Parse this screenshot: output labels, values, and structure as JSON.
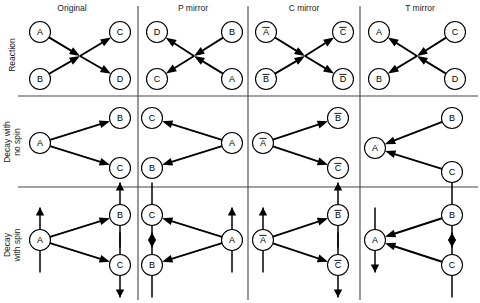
{
  "figure": {
    "background_color": "#ffffff",
    "line_color": "#000000",
    "grid_color": "#444444"
  },
  "columns": [
    {
      "key": "original",
      "label": "Original",
      "center_x": 72
    },
    {
      "key": "p_mirror",
      "label": "P mirror",
      "center_x": 193
    },
    {
      "key": "c_mirror",
      "label": "C mirror",
      "center_x": 304
    },
    {
      "key": "t_mirror",
      "label": "T mirror",
      "center_x": 420
    }
  ],
  "rows": [
    {
      "key": "reaction",
      "label": "Reaction",
      "label_lines": [
        "Reaction"
      ],
      "center_y": 55
    },
    {
      "key": "decay_no_spin",
      "label": "Decay with no spin",
      "label_lines": [
        "Decay with",
        "no spin"
      ],
      "center_y": 142
    },
    {
      "key": "decay_with_spin",
      "label": "Decay with spin",
      "label_lines": [
        "Decay",
        "with spin"
      ],
      "center_y": 245
    }
  ],
  "grid": {
    "horizontal_rules": [
      96,
      187
    ],
    "vertical_rules": [
      138,
      248,
      360
    ],
    "rule_x_start": 18,
    "rule_x_end": 478,
    "rule_y_start": 6,
    "rule_y_end": 300
  },
  "geometry": {
    "node_radius": 10.5,
    "spin_length": 22,
    "arrow_head_size": 5.5
  },
  "cells": [
    {
      "row": "reaction",
      "column": "original",
      "nodes": [
        {
          "id": "A",
          "label": "A",
          "bar": false,
          "x": 40,
          "y": 32
        },
        {
          "id": "B",
          "label": "B",
          "bar": false,
          "x": 40,
          "y": 79
        },
        {
          "id": "C",
          "label": "C",
          "bar": false,
          "x": 120,
          "y": 32
        },
        {
          "id": "D",
          "label": "D",
          "bar": false,
          "x": 120,
          "y": 79
        }
      ],
      "vertex": {
        "x": 80,
        "y": 56
      },
      "arrows": [
        {
          "from": "A",
          "to": "vertex",
          "head": "end"
        },
        {
          "from": "B",
          "to": "vertex",
          "head": "end"
        },
        {
          "from": "vertex",
          "to": "C",
          "head": "end"
        },
        {
          "from": "vertex",
          "to": "D",
          "head": "end"
        }
      ],
      "spins": []
    },
    {
      "row": "reaction",
      "column": "p_mirror",
      "nodes": [
        {
          "id": "D",
          "label": "D",
          "bar": false,
          "x": 157,
          "y": 32
        },
        {
          "id": "C",
          "label": "C",
          "bar": false,
          "x": 157,
          "y": 79
        },
        {
          "id": "B",
          "label": "B",
          "bar": false,
          "x": 232,
          "y": 32
        },
        {
          "id": "A",
          "label": "A",
          "bar": false,
          "x": 232,
          "y": 79
        }
      ],
      "vertex": {
        "x": 194,
        "y": 56
      },
      "arrows": [
        {
          "from": "B",
          "to": "vertex",
          "head": "end"
        },
        {
          "from": "A",
          "to": "vertex",
          "head": "end"
        },
        {
          "from": "vertex",
          "to": "D",
          "head": "end"
        },
        {
          "from": "vertex",
          "to": "C",
          "head": "end"
        }
      ],
      "spins": []
    },
    {
      "row": "reaction",
      "column": "c_mirror",
      "nodes": [
        {
          "id": "Abar",
          "label": "A",
          "bar": true,
          "x": 266,
          "y": 32
        },
        {
          "id": "Bbar",
          "label": "B",
          "bar": true,
          "x": 266,
          "y": 79
        },
        {
          "id": "Cbar",
          "label": "C",
          "bar": true,
          "x": 343,
          "y": 32
        },
        {
          "id": "Dbar",
          "label": "D",
          "bar": true,
          "x": 343,
          "y": 79
        }
      ],
      "vertex": {
        "x": 305,
        "y": 56
      },
      "arrows": [
        {
          "from": "Abar",
          "to": "vertex",
          "head": "end"
        },
        {
          "from": "Bbar",
          "to": "vertex",
          "head": "end"
        },
        {
          "from": "vertex",
          "to": "Cbar",
          "head": "end"
        },
        {
          "from": "vertex",
          "to": "Dbar",
          "head": "end"
        }
      ],
      "spins": []
    },
    {
      "row": "reaction",
      "column": "t_mirror",
      "nodes": [
        {
          "id": "A",
          "label": "A",
          "bar": false,
          "x": 379,
          "y": 32
        },
        {
          "id": "B",
          "label": "B",
          "bar": false,
          "x": 379,
          "y": 79
        },
        {
          "id": "C",
          "label": "C",
          "bar": false,
          "x": 455,
          "y": 32
        },
        {
          "id": "D",
          "label": "D",
          "bar": false,
          "x": 455,
          "y": 79
        }
      ],
      "vertex": {
        "x": 417,
        "y": 56
      },
      "arrows": [
        {
          "from": "C",
          "to": "vertex",
          "head": "end"
        },
        {
          "from": "D",
          "to": "vertex",
          "head": "end"
        },
        {
          "from": "vertex",
          "to": "A",
          "head": "end"
        },
        {
          "from": "vertex",
          "to": "B",
          "head": "end"
        }
      ],
      "spins": []
    },
    {
      "row": "decay_no_spin",
      "column": "original",
      "nodes": [
        {
          "id": "A",
          "label": "A",
          "bar": false,
          "x": 40,
          "y": 143
        },
        {
          "id": "B",
          "label": "B",
          "bar": false,
          "x": 120,
          "y": 118
        },
        {
          "id": "C",
          "label": "C",
          "bar": false,
          "x": 120,
          "y": 168
        }
      ],
      "vertex": null,
      "arrows": [
        {
          "from": "A",
          "to": "B",
          "head": "end"
        },
        {
          "from": "A",
          "to": "C",
          "head": "end"
        }
      ],
      "spins": []
    },
    {
      "row": "decay_no_spin",
      "column": "p_mirror",
      "nodes": [
        {
          "id": "C",
          "label": "C",
          "bar": false,
          "x": 152,
          "y": 118
        },
        {
          "id": "B",
          "label": "B",
          "bar": false,
          "x": 152,
          "y": 168
        },
        {
          "id": "A",
          "label": "A",
          "bar": false,
          "x": 232,
          "y": 143
        }
      ],
      "vertex": null,
      "arrows": [
        {
          "from": "A",
          "to": "C",
          "head": "end"
        },
        {
          "from": "A",
          "to": "B",
          "head": "end"
        }
      ],
      "spins": []
    },
    {
      "row": "decay_no_spin",
      "column": "c_mirror",
      "nodes": [
        {
          "id": "Abar",
          "label": "A",
          "bar": true,
          "x": 263,
          "y": 143
        },
        {
          "id": "Bbar",
          "label": "B",
          "bar": true,
          "x": 338,
          "y": 118
        },
        {
          "id": "Cbar",
          "label": "C",
          "bar": true,
          "x": 338,
          "y": 168
        }
      ],
      "vertex": null,
      "arrows": [
        {
          "from": "Abar",
          "to": "Bbar",
          "head": "end"
        },
        {
          "from": "Abar",
          "to": "Cbar",
          "head": "end"
        }
      ],
      "spins": []
    },
    {
      "row": "decay_no_spin",
      "column": "t_mirror",
      "nodes": [
        {
          "id": "A",
          "label": "A",
          "bar": false,
          "x": 375,
          "y": 148
        },
        {
          "id": "B",
          "label": "B",
          "bar": false,
          "x": 452,
          "y": 118
        },
        {
          "id": "C",
          "label": "C",
          "bar": false,
          "x": 452,
          "y": 172
        }
      ],
      "vertex": null,
      "arrows": [
        {
          "from": "B",
          "to": "A",
          "head": "end"
        },
        {
          "from": "C",
          "to": "A",
          "head": "end"
        }
      ],
      "spins": []
    },
    {
      "row": "decay_with_spin",
      "column": "original",
      "nodes": [
        {
          "id": "A",
          "label": "A",
          "bar": false,
          "x": 40,
          "y": 240
        },
        {
          "id": "B",
          "label": "B",
          "bar": false,
          "x": 120,
          "y": 215
        },
        {
          "id": "C",
          "label": "C",
          "bar": false,
          "x": 120,
          "y": 265
        }
      ],
      "vertex": null,
      "arrows": [
        {
          "from": "A",
          "to": "B",
          "head": "end"
        },
        {
          "from": "A",
          "to": "C",
          "head": "end"
        }
      ],
      "spins": [
        {
          "node": "A",
          "direction": "up"
        },
        {
          "node": "B",
          "direction": "up"
        },
        {
          "node": "C",
          "direction": "down"
        }
      ]
    },
    {
      "row": "decay_with_spin",
      "column": "p_mirror",
      "nodes": [
        {
          "id": "C",
          "label": "C",
          "bar": false,
          "x": 152,
          "y": 215
        },
        {
          "id": "B",
          "label": "B",
          "bar": false,
          "x": 152,
          "y": 265
        },
        {
          "id": "A",
          "label": "A",
          "bar": false,
          "x": 232,
          "y": 240
        }
      ],
      "vertex": null,
      "arrows": [
        {
          "from": "A",
          "to": "C",
          "head": "end"
        },
        {
          "from": "A",
          "to": "B",
          "head": "end"
        }
      ],
      "spins": [
        {
          "node": "C",
          "direction": "down"
        },
        {
          "node": "B",
          "direction": "up"
        },
        {
          "node": "A",
          "direction": "up"
        }
      ]
    },
    {
      "row": "decay_with_spin",
      "column": "c_mirror",
      "nodes": [
        {
          "id": "Abar",
          "label": "A",
          "bar": true,
          "x": 263,
          "y": 240
        },
        {
          "id": "Bbar",
          "label": "B",
          "bar": true,
          "x": 338,
          "y": 215
        },
        {
          "id": "Cbar",
          "label": "C",
          "bar": true,
          "x": 338,
          "y": 265
        }
      ],
      "vertex": null,
      "arrows": [
        {
          "from": "Abar",
          "to": "Bbar",
          "head": "end"
        },
        {
          "from": "Abar",
          "to": "Cbar",
          "head": "end"
        }
      ],
      "spins": [
        {
          "node": "Abar",
          "direction": "up"
        },
        {
          "node": "Bbar",
          "direction": "up"
        },
        {
          "node": "Cbar",
          "direction": "down"
        }
      ]
    },
    {
      "row": "decay_with_spin",
      "column": "t_mirror",
      "nodes": [
        {
          "id": "A",
          "label": "A",
          "bar": false,
          "x": 375,
          "y": 240
        },
        {
          "id": "B",
          "label": "B",
          "bar": false,
          "x": 452,
          "y": 215
        },
        {
          "id": "C",
          "label": "C",
          "bar": false,
          "x": 452,
          "y": 265
        }
      ],
      "vertex": null,
      "arrows": [
        {
          "from": "B",
          "to": "A",
          "head": "end"
        },
        {
          "from": "C",
          "to": "A",
          "head": "end"
        }
      ],
      "spins": [
        {
          "node": "A",
          "direction": "down"
        },
        {
          "node": "B",
          "direction": "down"
        },
        {
          "node": "C",
          "direction": "up"
        }
      ]
    }
  ]
}
